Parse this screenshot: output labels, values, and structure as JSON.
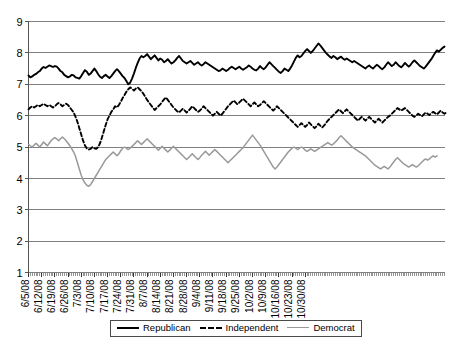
{
  "chart_data": {
    "type": "line",
    "title": "",
    "xlabel": "",
    "ylabel": "",
    "ylim": [
      1,
      9
    ],
    "yticks": [
      1,
      2,
      3,
      4,
      5,
      6,
      7,
      8,
      9
    ],
    "grid": true,
    "legend_position": "bottom",
    "x_tick_labels": [
      "6/5/08",
      "6/12/08",
      "6/19/08",
      "6/26/08",
      "7/3/08",
      "7/10/08",
      "7/17/08",
      "7/24/08",
      "7/31/08",
      "8/7/08",
      "8/14/08",
      "8/21/08",
      "8/28/08",
      "9/4/08",
      "9/11/08",
      "9/18/08",
      "9/25/08",
      "10/2/08",
      "10/9/08",
      "10/16/08",
      "10/23/08",
      "10/30/08"
    ],
    "x_tick_interval_days": 7,
    "x_start": "6/5/08",
    "x_end": "10/30/08",
    "series": [
      {
        "name": "Republican",
        "color": "#000000",
        "style": "solid",
        "values": [
          7.28,
          7.22,
          7.25,
          7.3,
          7.33,
          7.38,
          7.42,
          7.5,
          7.55,
          7.52,
          7.56,
          7.6,
          7.58,
          7.55,
          7.58,
          7.56,
          7.5,
          7.42,
          7.38,
          7.3,
          7.26,
          7.22,
          7.25,
          7.3,
          7.28,
          7.22,
          7.2,
          7.18,
          7.26,
          7.36,
          7.45,
          7.4,
          7.3,
          7.34,
          7.42,
          7.5,
          7.42,
          7.32,
          7.24,
          7.2,
          7.26,
          7.3,
          7.25,
          7.2,
          7.26,
          7.34,
          7.42,
          7.48,
          7.42,
          7.34,
          7.26,
          7.2,
          7.1,
          7.0,
          7.05,
          7.18,
          7.34,
          7.52,
          7.68,
          7.82,
          7.9,
          7.86,
          7.9,
          7.96,
          7.88,
          7.8,
          7.86,
          7.92,
          7.84,
          7.76,
          7.82,
          7.78,
          7.7,
          7.74,
          7.8,
          7.72,
          7.66,
          7.7,
          7.76,
          7.84,
          7.9,
          7.82,
          7.74,
          7.7,
          7.66,
          7.7,
          7.74,
          7.68,
          7.62,
          7.66,
          7.7,
          7.64,
          7.6,
          7.64,
          7.7,
          7.66,
          7.62,
          7.58,
          7.54,
          7.5,
          7.46,
          7.42,
          7.44,
          7.5,
          7.46,
          7.42,
          7.46,
          7.52,
          7.56,
          7.52,
          7.48,
          7.52,
          7.56,
          7.5,
          7.46,
          7.5,
          7.54,
          7.6,
          7.56,
          7.5,
          7.46,
          7.44,
          7.5,
          7.58,
          7.52,
          7.48,
          7.54,
          7.62,
          7.7,
          7.64,
          7.58,
          7.52,
          7.46,
          7.4,
          7.36,
          7.42,
          7.5,
          7.46,
          7.42,
          7.5,
          7.6,
          7.72,
          7.84,
          7.92,
          7.86,
          7.9,
          7.98,
          8.06,
          8.12,
          8.06,
          8.0,
          8.06,
          8.14,
          8.22,
          8.3,
          8.24,
          8.16,
          8.08,
          8.0,
          7.94,
          7.88,
          7.84,
          7.9,
          7.86,
          7.8,
          7.84,
          7.88,
          7.82,
          7.78,
          7.82,
          7.78,
          7.74,
          7.7,
          7.74,
          7.7,
          7.66,
          7.62,
          7.58,
          7.54,
          7.5,
          7.56,
          7.6,
          7.54,
          7.5,
          7.56,
          7.62,
          7.58,
          7.52,
          7.48,
          7.54,
          7.62,
          7.7,
          7.64,
          7.58,
          7.62,
          7.7,
          7.64,
          7.58,
          7.54,
          7.6,
          7.68,
          7.62,
          7.56,
          7.62,
          7.7,
          7.76,
          7.7,
          7.64,
          7.58,
          7.54,
          7.5,
          7.56,
          7.64,
          7.72,
          7.8,
          7.9,
          8.0,
          8.08,
          8.04,
          8.1,
          8.16,
          8.2
        ]
      },
      {
        "name": "Independent",
        "color": "#000000",
        "style": "dashed",
        "values": [
          6.2,
          6.26,
          6.3,
          6.26,
          6.3,
          6.34,
          6.3,
          6.34,
          6.38,
          6.34,
          6.3,
          6.34,
          6.3,
          6.26,
          6.3,
          6.36,
          6.4,
          6.36,
          6.3,
          6.34,
          6.38,
          6.34,
          6.26,
          6.18,
          6.1,
          5.96,
          5.8,
          5.6,
          5.4,
          5.2,
          5.05,
          4.95,
          4.92,
          4.94,
          5.0,
          4.96,
          4.94,
          5.0,
          5.12,
          5.3,
          5.5,
          5.7,
          5.88,
          6.0,
          6.12,
          6.2,
          6.3,
          6.26,
          6.34,
          6.44,
          6.56,
          6.66,
          6.76,
          6.84,
          6.9,
          6.86,
          6.8,
          6.86,
          6.9,
          6.84,
          6.78,
          6.7,
          6.6,
          6.5,
          6.42,
          6.34,
          6.26,
          6.18,
          6.24,
          6.3,
          6.36,
          6.44,
          6.52,
          6.58,
          6.5,
          6.42,
          6.34,
          6.26,
          6.2,
          6.14,
          6.1,
          6.16,
          6.22,
          6.16,
          6.1,
          6.16,
          6.22,
          6.3,
          6.24,
          6.18,
          6.12,
          6.16,
          6.22,
          6.3,
          6.24,
          6.18,
          6.12,
          6.06,
          6.0,
          6.06,
          6.12,
          6.06,
          6.0,
          6.06,
          6.14,
          6.22,
          6.3,
          6.36,
          6.42,
          6.48,
          6.42,
          6.36,
          6.42,
          6.48,
          6.54,
          6.48,
          6.42,
          6.36,
          6.3,
          6.36,
          6.42,
          6.36,
          6.3,
          6.34,
          6.4,
          6.46,
          6.4,
          6.34,
          6.28,
          6.22,
          6.16,
          6.22,
          6.3,
          6.24,
          6.18,
          6.12,
          6.06,
          6.0,
          5.94,
          5.88,
          5.82,
          5.76,
          5.7,
          5.64,
          5.7,
          5.76,
          5.7,
          5.64,
          5.7,
          5.78,
          5.72,
          5.66,
          5.6,
          5.66,
          5.74,
          5.68,
          5.62,
          5.68,
          5.76,
          5.84,
          5.9,
          5.96,
          6.02,
          6.08,
          6.14,
          6.2,
          6.14,
          6.08,
          6.14,
          6.2,
          6.14,
          6.08,
          6.02,
          5.96,
          5.9,
          5.84,
          5.9,
          5.96,
          5.9,
          5.84,
          5.9,
          5.96,
          5.9,
          5.84,
          5.78,
          5.84,
          5.9,
          5.84,
          5.78,
          5.84,
          5.9,
          5.96,
          6.0,
          6.06,
          6.12,
          6.18,
          6.24,
          6.2,
          6.16,
          6.2,
          6.24,
          6.18,
          6.12,
          6.06,
          6.0,
          5.96,
          6.0,
          6.06,
          6.02,
          5.98,
          6.04,
          6.1,
          6.06,
          6.02,
          6.08,
          6.12,
          6.08,
          6.04,
          6.1,
          6.16,
          6.1,
          6.06,
          6.1
        ]
      },
      {
        "name": "Democrat",
        "color": "#999999",
        "style": "solid",
        "values": [
          5.08,
          5.04,
          5.0,
          5.06,
          5.12,
          5.06,
          5.0,
          5.08,
          5.16,
          5.1,
          5.04,
          5.12,
          5.2,
          5.26,
          5.3,
          5.26,
          5.2,
          5.26,
          5.32,
          5.26,
          5.2,
          5.12,
          5.04,
          4.94,
          4.84,
          4.7,
          4.5,
          4.3,
          4.1,
          3.95,
          3.85,
          3.78,
          3.75,
          3.8,
          3.9,
          4.0,
          4.1,
          4.2,
          4.3,
          4.4,
          4.5,
          4.6,
          4.66,
          4.72,
          4.78,
          4.84,
          4.78,
          4.72,
          4.78,
          4.88,
          4.96,
          5.0,
          4.96,
          4.92,
          4.96,
          5.02,
          5.08,
          5.14,
          5.2,
          5.14,
          5.08,
          5.14,
          5.2,
          5.26,
          5.2,
          5.14,
          5.08,
          5.02,
          4.96,
          4.9,
          4.96,
          5.02,
          4.96,
          4.9,
          4.84,
          4.9,
          4.96,
          5.02,
          4.96,
          4.9,
          4.84,
          4.78,
          4.72,
          4.66,
          4.6,
          4.66,
          4.72,
          4.78,
          4.72,
          4.66,
          4.6,
          4.66,
          4.74,
          4.8,
          4.86,
          4.8,
          4.74,
          4.8,
          4.86,
          4.92,
          4.86,
          4.8,
          4.74,
          4.68,
          4.62,
          4.56,
          4.5,
          4.56,
          4.62,
          4.68,
          4.74,
          4.8,
          4.86,
          4.92,
          4.98,
          5.06,
          5.14,
          5.22,
          5.3,
          5.38,
          5.3,
          5.22,
          5.14,
          5.06,
          4.96,
          4.86,
          4.76,
          4.66,
          4.56,
          4.46,
          4.36,
          4.3,
          4.36,
          4.44,
          4.52,
          4.6,
          4.68,
          4.76,
          4.84,
          4.9,
          4.96,
          5.0,
          4.96,
          4.92,
          4.96,
          5.0,
          4.96,
          4.9,
          4.86,
          4.9,
          4.94,
          4.9,
          4.86,
          4.9,
          4.94,
          4.98,
          5.02,
          5.06,
          5.1,
          5.14,
          5.1,
          5.06,
          5.1,
          5.16,
          5.22,
          5.3,
          5.36,
          5.3,
          5.24,
          5.18,
          5.12,
          5.06,
          5.0,
          4.96,
          4.92,
          4.88,
          4.84,
          4.8,
          4.76,
          4.72,
          4.66,
          4.6,
          4.54,
          4.48,
          4.42,
          4.38,
          4.34,
          4.3,
          4.34,
          4.38,
          4.34,
          4.3,
          4.36,
          4.44,
          4.52,
          4.6,
          4.66,
          4.6,
          4.54,
          4.48,
          4.44,
          4.4,
          4.36,
          4.4,
          4.44,
          4.4,
          4.36,
          4.4,
          4.46,
          4.52,
          4.58,
          4.62,
          4.58,
          4.62,
          4.68,
          4.72,
          4.68,
          4.72
        ]
      }
    ]
  },
  "legend": {
    "items": [
      {
        "label": "Republican"
      },
      {
        "label": "Independent"
      },
      {
        "label": "Democrat"
      }
    ]
  },
  "caption": {
    "text": ""
  }
}
